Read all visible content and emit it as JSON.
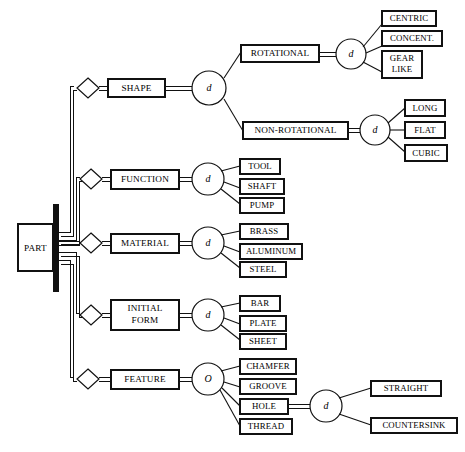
{
  "diagram": {
    "type": "eer-specialization-diagram",
    "root_entity": {
      "label": "PART",
      "participation": "total"
    },
    "specializations": [
      {
        "id": "shape",
        "attribute_label": "SHAPE",
        "disjoint_symbol": "d",
        "disjoint_meaning": "disjoint",
        "subclasses": [
          {
            "label": "ROTATIONAL",
            "disjoint_symbol": "d",
            "subclasses": [
              {
                "label": "CENTRIC"
              },
              {
                "label": "CONCENT."
              },
              {
                "label": "GEAR LIKE",
                "lines": [
                  "GEAR",
                  "LIKE"
                ]
              }
            ]
          },
          {
            "label": "NON-ROTATIONAL",
            "disjoint_symbol": "d",
            "subclasses": [
              {
                "label": "LONG"
              },
              {
                "label": "FLAT"
              },
              {
                "label": "CUBIC"
              }
            ]
          }
        ]
      },
      {
        "id": "function",
        "attribute_label": "FUNCTION",
        "disjoint_symbol": "d",
        "disjoint_meaning": "disjoint",
        "subclasses": [
          {
            "label": "TOOL"
          },
          {
            "label": "SHAFT"
          },
          {
            "label": "PUMP"
          }
        ]
      },
      {
        "id": "material",
        "attribute_label": "MATERIAL",
        "disjoint_symbol": "d",
        "disjoint_meaning": "disjoint",
        "subclasses": [
          {
            "label": "BRASS"
          },
          {
            "label": "ALUMINUM"
          },
          {
            "label": "STEEL"
          }
        ]
      },
      {
        "id": "initial-form",
        "attribute_label": "INITIAL FORM",
        "attribute_lines": [
          "INITIAL",
          "FORM"
        ],
        "disjoint_symbol": "d",
        "disjoint_meaning": "disjoint",
        "subclasses": [
          {
            "label": "BAR"
          },
          {
            "label": "PLATE"
          },
          {
            "label": "SHEET"
          }
        ]
      },
      {
        "id": "feature",
        "attribute_label": "FEATURE",
        "disjoint_symbol": "O",
        "disjoint_meaning": "overlapping",
        "subclasses": [
          {
            "label": "CHAMFER"
          },
          {
            "label": "GROOVE"
          },
          {
            "label": "HOLE",
            "disjoint_symbol": "d",
            "subclasses": [
              {
                "label": "STRAIGHT"
              },
              {
                "label": "COUNTERSINK"
              }
            ]
          },
          {
            "label": "THREAD"
          }
        ]
      }
    ],
    "colors": {
      "stroke": "#111111",
      "fill": "#ffffff",
      "text": "#000000"
    }
  }
}
